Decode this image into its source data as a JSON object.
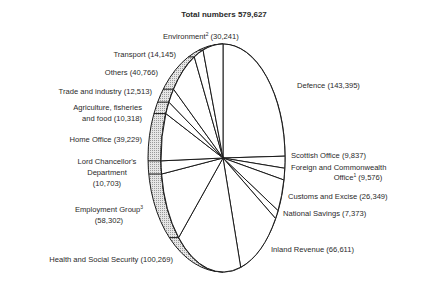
{
  "chart_data": {
    "type": "pie",
    "title": "Total numbers 579,627",
    "total": 579627,
    "style": {
      "line_color": "#1a1a1a",
      "rim_fill": "#d9d9d9",
      "face_fill": "#ffffff",
      "text_color": "#2a2a2a"
    },
    "slices": [
      {
        "name": "Defence",
        "value": 143395,
        "label": "Defence (143,395)",
        "sup": ""
      },
      {
        "name": "Scottish Office",
        "value": 9837,
        "label": "Scottish Office (9,837)",
        "sup": ""
      },
      {
        "name": "Foreign and Commonwealth Office",
        "value": 9576,
        "label_lines": [
          "Foreign and Commonwealth",
          "Office",
          " (9,576)"
        ],
        "sup": "1"
      },
      {
        "name": "Customs and Excise",
        "value": 26349,
        "label": "Customs and Excise (26,349)",
        "sup": ""
      },
      {
        "name": "National Savings",
        "value": 7373,
        "label": "National Savings (7,373)",
        "sup": ""
      },
      {
        "name": "Inland Revenue",
        "value": 66611,
        "label": "Inland Revenue (66,611)",
        "sup": ""
      },
      {
        "name": "Health and Social Security",
        "value": 100269,
        "label": "Health and Social Security (100,269)",
        "sup": ""
      },
      {
        "name": "Employment Group",
        "value": 58302,
        "label_lines": [
          "Employment Group",
          "(58,302)"
        ],
        "sup": "3"
      },
      {
        "name": "Lord Chancellor's Department",
        "value": 10703,
        "label_lines": [
          "Lord Chancellor's",
          "Department",
          "(10,703)"
        ],
        "sup": ""
      },
      {
        "name": "Home Office",
        "value": 39229,
        "label": "Home Office (39,229)",
        "sup": ""
      },
      {
        "name": "Agriculture, fisheries and food",
        "value": 10318,
        "label_lines": [
          "Agriculture, fisheries",
          "and food (10,318)"
        ],
        "sup": ""
      },
      {
        "name": "Trade and industry",
        "value": 12513,
        "label": "Trade and industry (12,513)",
        "sup": ""
      },
      {
        "name": "Others",
        "value": 40766,
        "label": "Others (40,766)",
        "sup": ""
      },
      {
        "name": "Transport",
        "value": 14145,
        "label": "Transport (14,145)",
        "sup": ""
      },
      {
        "name": "Environment",
        "value": 30241,
        "label_lines": [
          "Environment",
          " (30,241)"
        ],
        "sup": "2"
      }
    ]
  }
}
